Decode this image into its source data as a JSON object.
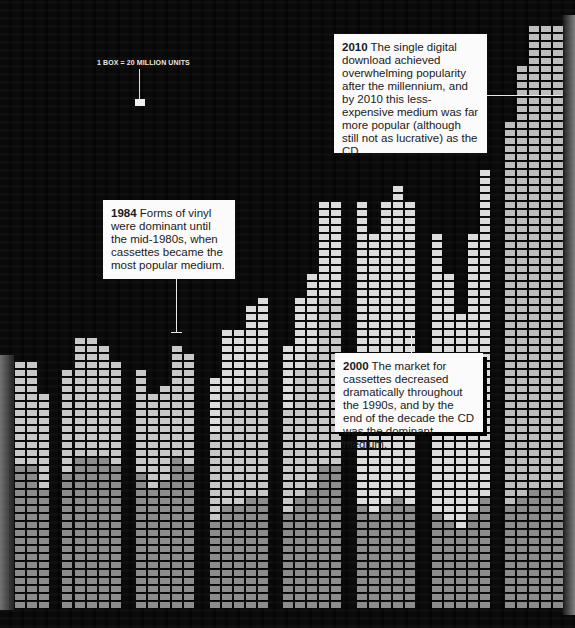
{
  "chart_data": {
    "type": "bar",
    "legend_note": "1 BOX = 20 MILLION UNITS",
    "unit_per_box_millions": 20,
    "xlabel": "",
    "ylabel": "Units sold",
    "grid": false,
    "box_pitch": {
      "x": 12,
      "y": 8
    },
    "baseline_y": 610,
    "groups": [
      {
        "x": [
          15,
          27,
          39
        ],
        "top_y": [
          362,
          362,
          392
        ]
      },
      {
        "x": [
          62,
          75,
          87,
          99,
          111
        ],
        "top_y": [
          368,
          337,
          333,
          345,
          355
        ]
      },
      {
        "x": [
          136,
          148,
          160,
          172,
          184
        ],
        "top_y": [
          365,
          392,
          385,
          340,
          350
        ]
      },
      {
        "x": [
          210,
          222,
          234,
          246,
          258
        ],
        "top_y": [
          372,
          327,
          330,
          305,
          294
        ]
      },
      {
        "x": [
          283,
          295,
          307,
          319,
          331
        ],
        "top_y": [
          340,
          292,
          272,
          197,
          197
        ]
      },
      {
        "x": [
          357,
          369,
          381,
          393,
          405
        ],
        "top_y": [
          197,
          232,
          202,
          181,
          197
        ]
      },
      {
        "x": [
          432,
          444,
          456,
          468,
          480
        ],
        "top_y": [
          228,
          270,
          308,
          228,
          170
        ]
      },
      {
        "x": [
          505,
          517,
          529,
          541,
          553
        ],
        "top_y": [
          115,
          60,
          20,
          20,
          20
        ]
      }
    ],
    "boxes_per_column_estimate": [
      [
        31,
        31,
        27
      ],
      [
        30,
        34,
        35,
        33,
        32
      ],
      [
        31,
        27,
        28,
        34,
        33
      ],
      [
        30,
        35,
        35,
        38,
        40
      ],
      [
        34,
        40,
        42,
        51,
        51
      ],
      [
        51,
        47,
        51,
        54,
        51
      ],
      [
        48,
        43,
        38,
        48,
        55
      ],
      [
        62,
        69,
        74,
        74,
        74
      ]
    ],
    "shade_colors": {
      "vinyl": "#8c8c8c",
      "cassette": "#c8c8c8",
      "cd": "#dcdcdc",
      "digital": "#bdbdbd",
      "dark": "#1a1a1a"
    }
  },
  "scale": {
    "label": "1 BOX = 20 MILLION UNITS"
  },
  "callouts": [
    {
      "year": "2010",
      "text": "The single digital download achieved overwhelming popularity after the millennium, and by 2010 this less-expensive medium was far more popular (although still not as lucrative) as the CD."
    },
    {
      "year": "1984",
      "text": "Forms of vinyl were dominant until the mid-1980s, when cassettes became the most popular medium."
    },
    {
      "year": "2000",
      "text": "The market for cassettes decreased dramatically throughout the 1990s, and by the end of the decade the CD was the dominant medium."
    }
  ]
}
